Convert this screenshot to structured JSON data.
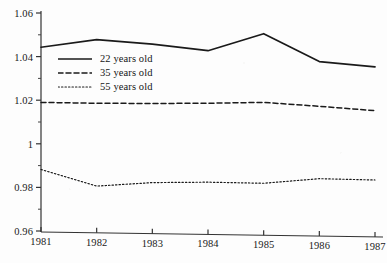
{
  "chart_data": {
    "type": "line",
    "title": "",
    "subtitle": "",
    "xlabel": "",
    "ylabel": "",
    "x": [
      1981,
      1982,
      1983,
      1984,
      1985,
      1986,
      1987
    ],
    "categories": [
      "1981",
      "1982",
      "1983",
      "1984",
      "1985",
      "1986",
      "1987"
    ],
    "xlim": [
      1981,
      1987
    ],
    "ylim": [
      0.96,
      1.06
    ],
    "grid": false,
    "legend_position": "upper-left-inside",
    "y_major_ticks": [
      0.96,
      0.98,
      1.0,
      1.02,
      1.04,
      1.06
    ],
    "y_tick_labels": [
      "0.96",
      "0.98",
      "1",
      "1.02",
      "1.04",
      "1.06"
    ],
    "y_minor_ticks": [
      0.97,
      0.99,
      1.01,
      1.03,
      1.05
    ],
    "x_tick_labels": [
      "1981",
      "1982",
      "1983",
      "1984",
      "1985",
      "1986",
      "1987"
    ],
    "series": [
      {
        "name": "22 years old",
        "style": "solid",
        "color": "#1a1a1a",
        "values": [
          1.0443,
          1.0478,
          1.0457,
          1.0427,
          1.0505,
          1.0377,
          1.0353
        ]
      },
      {
        "name": "35 years old",
        "style": "dashed",
        "color": "#1a1a1a",
        "values": [
          1.019,
          1.0186,
          1.0185,
          1.0186,
          1.019,
          1.0172,
          1.0152
        ]
      },
      {
        "name": "55 years old",
        "style": "dotted",
        "color": "#1a1a1a",
        "values": [
          0.9882,
          0.9806,
          0.9822,
          0.9824,
          0.9819,
          0.984,
          0.9834
        ]
      }
    ]
  },
  "axes": {
    "y_labels": [
      {
        "text": "1.06",
        "value": 1.06
      },
      {
        "text": "1.04",
        "value": 1.04
      },
      {
        "text": "1.02",
        "value": 1.02
      },
      {
        "text": "1",
        "value": 1.0
      },
      {
        "text": "0.98",
        "value": 0.98
      },
      {
        "text": "0.96",
        "value": 0.96
      }
    ],
    "x_labels": [
      {
        "text": "1981",
        "value": 1981
      },
      {
        "text": "1982",
        "value": 1982
      },
      {
        "text": "1983",
        "value": 1983
      },
      {
        "text": "1984",
        "value": 1984
      },
      {
        "text": "1985",
        "value": 1985
      },
      {
        "text": "1986",
        "value": 1986
      },
      {
        "text": "1987",
        "value": 1987
      }
    ]
  },
  "legend": {
    "entries": [
      {
        "label": "22 years old",
        "style": "solid"
      },
      {
        "label": "35 years old",
        "style": "dashed"
      },
      {
        "label": "55 years old",
        "style": "dotted"
      }
    ]
  },
  "colors": {
    "ink": "#1a1a1a",
    "axis": "#333333",
    "background": "#fdfdfd"
  }
}
